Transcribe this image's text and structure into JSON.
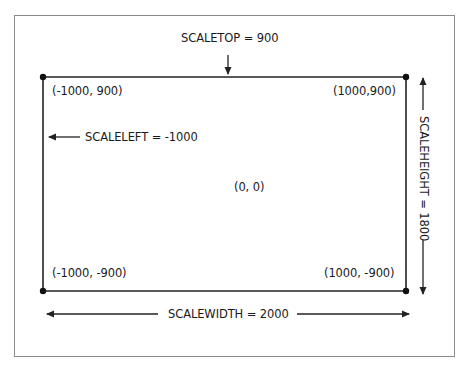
{
  "diagram": {
    "type": "coordinate-system",
    "colors": {
      "line": "#222222",
      "frame": "#8a8a8a",
      "text": "#1a1a1a",
      "background": "#ffffff"
    },
    "labels": {
      "scaletop": "SCALETOP = 900",
      "scaleleft": "SCALELEFT = -1000",
      "scaleheight": "SCALEHEIGHT = 1800",
      "scalewidth": "SCALEWIDTH = 2000"
    },
    "corners": {
      "top_left": "(-1000, 900)",
      "top_right": "(1000,900)",
      "bottom_left": "(-1000, -900)",
      "bottom_right": "(1000, -900)"
    },
    "center": "(0, 0)",
    "scale": {
      "top": 900,
      "left": -1000,
      "height": 1800,
      "width": 2000
    }
  }
}
